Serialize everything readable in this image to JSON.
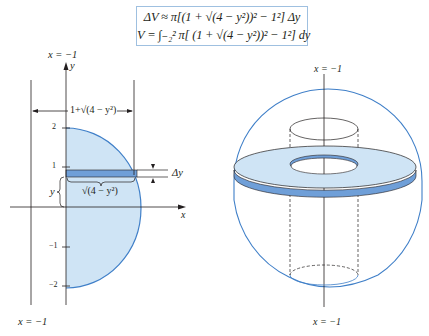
{
  "formula_box": {
    "line1": "ΔV ≈ π[(1 + √(4 − y²))² − 1²] Δy",
    "line2": "V = ∫₋₂² π[ (1 + √(4 − y²))² − 1²] dy"
  },
  "left_figure": {
    "axis_line_label_top": "x = −1",
    "axis_line_label_bottom": "x = −1",
    "y_axis_label": "y",
    "x_axis_label": "x",
    "width_label": "1+√(4 − y²)",
    "delta_label": "Δy",
    "radius_label": "√(4 − y²)",
    "y_label": "y",
    "ticks": [
      "2",
      "1",
      "−1",
      "−2"
    ]
  },
  "right_figure": {
    "axis_label_top": "x = −1",
    "axis_label_bottom": "x = −1"
  },
  "colors": {
    "region_fill": "#cfe4f5",
    "strip_fill": "#6f9fd8",
    "curve": "#3f7fc8",
    "box_border": "#9fc0e0",
    "ink": "#231f20"
  }
}
